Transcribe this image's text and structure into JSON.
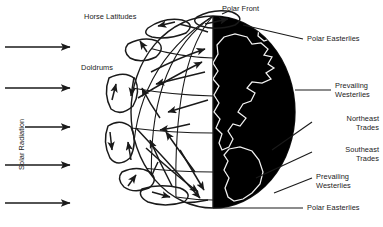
{
  "figure": {
    "kind": "diagram",
    "colors": {
      "ink": "#1a1a1a",
      "night_hemisphere": "#000000",
      "coastline": "#f2f2f2",
      "background": "#ffffff"
    }
  },
  "labels": {
    "solar_radiation": "Solar Radiation",
    "horse_latitudes": "Horse Latitudes",
    "doldrums": "Doldrums",
    "polar_front": "Polar Front",
    "polar_easterlies_north": "Polar Easterlies",
    "prevailing_westerlies_north_line1": "Prevailing",
    "prevailing_westerlies_north_line2": "Westerlies",
    "northeast_trades_line1": "Northeast",
    "northeast_trades_line2": "Trades",
    "southeast_trades_line1": "Southeast",
    "southeast_trades_line2": "Trades",
    "prevailing_westerlies_south_line1": "Prevailing",
    "prevailing_westerlies_south_line2": "Westerlies",
    "polar_easterlies_south": "Polar Easterlies"
  },
  "icons": {
    "solar_arrow": "arrow-right-icon",
    "circulation_cell": "circulation-loop-icon",
    "wind_arrow": "wind-arrow-icon",
    "globe": "globe-icon",
    "leader_line": "leader-line-icon"
  },
  "solar_rays": [
    {
      "y": 47,
      "x1": 5,
      "x2": 72
    },
    {
      "y": 88,
      "x1": 5,
      "x2": 72
    },
    {
      "y": 127,
      "x1": 25,
      "x2": 72
    },
    {
      "y": 165,
      "x1": 5,
      "x2": 72
    },
    {
      "y": 203,
      "x1": 5,
      "x2": 72
    }
  ]
}
